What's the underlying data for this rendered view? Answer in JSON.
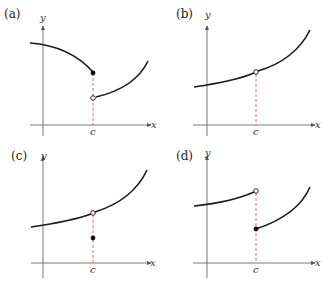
{
  "panels": [
    {
      "id": "a",
      "label": "(a)",
      "y_axis": "y",
      "x_axis": "x",
      "c_label": "c",
      "description": "Jump discontinuity: left piece ends with filled dot at c, right piece starts with open dot below"
    },
    {
      "id": "b",
      "label": "(b)",
      "y_axis": "y",
      "x_axis": "x",
      "c_label": "c",
      "description": "Removable discontinuity: continuous curve with open dot at c, f(c) undefined"
    },
    {
      "id": "c",
      "label": "(c)",
      "y_axis": "y",
      "x_axis": "x",
      "c_label": "c",
      "description": "Removable discontinuity: open dot on curve at c, filled dot below defines f(c)"
    },
    {
      "id": "d",
      "label": "(d)",
      "y_axis": "y",
      "x_axis": "x",
      "c_label": "c",
      "description": "Jump discontinuity: left piece ends with open dot at c, right piece starts with filled dot below"
    }
  ],
  "colors": {
    "curve": "#1a1a1a",
    "axis": "#555555",
    "dashed": "#e0483c",
    "point": "#111111"
  }
}
